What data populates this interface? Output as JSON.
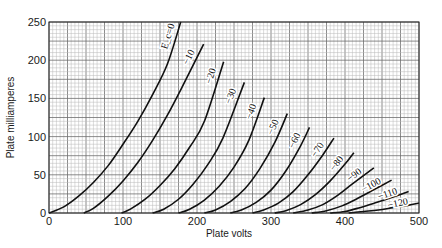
{
  "chart_data": {
    "type": "line",
    "title": "",
    "xlabel": "Plate volts",
    "ylabel": "Plate milliamperes",
    "xlim": [
      0,
      500
    ],
    "ylim": [
      0,
      250
    ],
    "x_ticks": [
      0,
      100,
      200,
      300,
      400,
      500
    ],
    "y_ticks": [
      0,
      50,
      100,
      150,
      200,
      250
    ],
    "grid": true,
    "grid_minor_step": 5,
    "grid_major_step": 25,
    "legend": "inline labels on curves",
    "series_parameter": "Grid bias E_c (volts)",
    "series": [
      {
        "name": "E_c = 0",
        "label": "E_c=0",
        "bias": 0,
        "points": [
          [
            0,
            0
          ],
          [
            20,
            8
          ],
          [
            40,
            22
          ],
          [
            60,
            40
          ],
          [
            80,
            62
          ],
          [
            100,
            90
          ],
          [
            120,
            120
          ],
          [
            140,
            155
          ],
          [
            160,
            195
          ],
          [
            178,
            250
          ]
        ]
      },
      {
        "name": "-10",
        "label": "−10",
        "bias": -10,
        "points": [
          [
            47,
            0
          ],
          [
            60,
            6
          ],
          [
            80,
            22
          ],
          [
            100,
            42
          ],
          [
            120,
            66
          ],
          [
            140,
            95
          ],
          [
            160,
            128
          ],
          [
            180,
            165
          ],
          [
            209,
            221
          ]
        ]
      },
      {
        "name": "-20",
        "label": "−20",
        "bias": -20,
        "points": [
          [
            98,
            0
          ],
          [
            110,
            5
          ],
          [
            130,
            18
          ],
          [
            150,
            36
          ],
          [
            170,
            58
          ],
          [
            190,
            86
          ],
          [
            210,
            120
          ],
          [
            236,
            198
          ]
        ]
      },
      {
        "name": "-30",
        "label": "−30",
        "bias": -30,
        "points": [
          [
            140,
            0
          ],
          [
            155,
            5
          ],
          [
            175,
            18
          ],
          [
            195,
            38
          ],
          [
            215,
            64
          ],
          [
            235,
            98
          ],
          [
            264,
            171
          ]
        ]
      },
      {
        "name": "-40",
        "label": "−40",
        "bias": -40,
        "points": [
          [
            175,
            0
          ],
          [
            190,
            5
          ],
          [
            210,
            17
          ],
          [
            230,
            35
          ],
          [
            250,
            60
          ],
          [
            270,
            95
          ],
          [
            291,
            151
          ]
        ]
      },
      {
        "name": "-50",
        "label": "−50",
        "bias": -50,
        "points": [
          [
            210,
            0
          ],
          [
            225,
            4
          ],
          [
            245,
            15
          ],
          [
            265,
            32
          ],
          [
            285,
            58
          ],
          [
            305,
            92
          ],
          [
            322,
            130
          ]
        ]
      },
      {
        "name": "-60",
        "label": "−60",
        "bias": -60,
        "points": [
          [
            245,
            0
          ],
          [
            260,
            4
          ],
          [
            280,
            14
          ],
          [
            300,
            30
          ],
          [
            320,
            55
          ],
          [
            340,
            88
          ],
          [
            352,
            112
          ]
        ]
      },
      {
        "name": "-70",
        "label": "−70",
        "bias": -70,
        "points": [
          [
            275,
            0
          ],
          [
            290,
            4
          ],
          [
            310,
            13
          ],
          [
            330,
            28
          ],
          [
            350,
            50
          ],
          [
            370,
            76
          ],
          [
            385,
            98
          ]
        ]
      },
      {
        "name": "-80",
        "label": "−80",
        "bias": -80,
        "points": [
          [
            305,
            0
          ],
          [
            320,
            3
          ],
          [
            340,
            11
          ],
          [
            360,
            24
          ],
          [
            380,
            42
          ],
          [
            400,
            64
          ],
          [
            412,
            79
          ]
        ]
      },
      {
        "name": "-90",
        "label": "−90",
        "bias": -90,
        "points": [
          [
            330,
            0
          ],
          [
            350,
            4
          ],
          [
            370,
            11
          ],
          [
            390,
            23
          ],
          [
            410,
            38
          ],
          [
            439,
            59
          ]
        ]
      },
      {
        "name": "-100",
        "label": "−100",
        "bias": -100,
        "points": [
          [
            355,
            0
          ],
          [
            375,
            3
          ],
          [
            395,
            9
          ],
          [
            415,
            18
          ],
          [
            440,
            31
          ],
          [
            463,
            43
          ]
        ]
      },
      {
        "name": "-110",
        "label": "−110",
        "bias": -110,
        "points": [
          [
            380,
            0
          ],
          [
            400,
            2
          ],
          [
            420,
            7
          ],
          [
            440,
            13
          ],
          [
            465,
            21
          ],
          [
            486,
            28
          ]
        ]
      },
      {
        "name": "-120",
        "label": "−120",
        "bias": -120,
        "points": [
          [
            405,
            0
          ],
          [
            425,
            2
          ],
          [
            445,
            4
          ],
          [
            465,
            7
          ],
          [
            485,
            10
          ],
          [
            500,
            13
          ]
        ]
      }
    ]
  },
  "colors": {
    "background": "#ffffff",
    "grid_minor": "#b8b8b8",
    "grid_major": "#6e6e6e",
    "curve": "#111111",
    "text": "#1a1a1a"
  }
}
